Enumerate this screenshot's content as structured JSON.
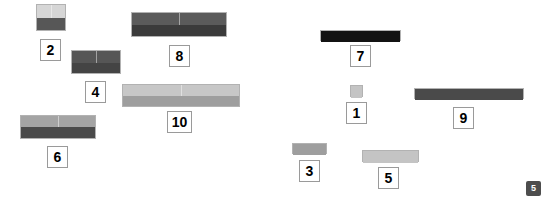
{
  "canvas": {
    "width": 549,
    "height": 205,
    "background": "#ffffff"
  },
  "palette": {
    "very_light_gray": "#e3e3e3",
    "light_gray": "#c9c9c9",
    "medium_light_gray": "#b5b5b5",
    "medium_gray": "#9e9e9e",
    "dark_gray": "#575757",
    "darker_gray": "#3f3f3f",
    "near_black": "#2b2b2b",
    "black": "#111111",
    "label_border": "#9a9a9a",
    "label_text": "#000000",
    "badge_bg": "#4d4d4d",
    "badge_text": "#ffffff"
  },
  "corner_badge": {
    "label": "5",
    "x": 526,
    "y": 181,
    "width": 15,
    "height": 15,
    "font_size": 9
  },
  "chart_data": {
    "type": "bar",
    "title": "",
    "xlabel": "",
    "ylabel": "",
    "categories": [
      "2",
      "8",
      "4",
      "10",
      "6",
      "7",
      "1",
      "9",
      "3",
      "5"
    ],
    "values": [
      2,
      8,
      4,
      10,
      6,
      7,
      1,
      9,
      3,
      5
    ],
    "legend": []
  },
  "rods": [
    {
      "id": "rod-2",
      "label": "2",
      "value": 2,
      "x": 36,
      "y": 4,
      "width": 30,
      "height": 27,
      "cells": 2,
      "top_color": "#d6d6d6",
      "bottom_color": "#575757",
      "top_height": 13,
      "label_x": 40,
      "label_y": 39,
      "label_w": 21,
      "label_h": 22,
      "label_font_size": 14
    },
    {
      "id": "rod-8",
      "label": "8",
      "value": 8,
      "x": 131,
      "y": 12,
      "width": 96,
      "height": 25,
      "cells": 2,
      "top_color": "#5b5b5b",
      "bottom_color": "#3b3b3b",
      "top_height": 12,
      "label_x": 169,
      "label_y": 45,
      "label_w": 21,
      "label_h": 22,
      "label_font_size": 14
    },
    {
      "id": "rod-4",
      "label": "4",
      "value": 4,
      "x": 71,
      "y": 50,
      "width": 50,
      "height": 24,
      "cells": 2,
      "top_color": "#565656",
      "bottom_color": "#444444",
      "top_height": 12,
      "label_x": 85,
      "label_y": 81,
      "label_w": 21,
      "label_h": 22,
      "label_font_size": 14
    },
    {
      "id": "rod-10",
      "label": "10",
      "value": 10,
      "x": 122,
      "y": 84,
      "width": 118,
      "height": 23,
      "cells": 2,
      "top_color": "#c7c7c7",
      "bottom_color": "#9e9e9e",
      "top_height": 11,
      "label_x": 167,
      "label_y": 111,
      "label_w": 25,
      "label_h": 22,
      "label_font_size": 14
    },
    {
      "id": "rod-6",
      "label": "6",
      "value": 6,
      "x": 20,
      "y": 115,
      "width": 76,
      "height": 24,
      "cells": 2,
      "top_color": "#a4a4a4",
      "bottom_color": "#4a4a4a",
      "top_height": 11,
      "label_x": 47,
      "label_y": 146,
      "label_w": 21,
      "label_h": 22,
      "label_font_size": 14
    },
    {
      "id": "rod-7",
      "label": "7",
      "value": 7,
      "x": 320,
      "y": 30,
      "width": 81,
      "height": 11,
      "cells": 1,
      "top_color": "#131313",
      "bottom_color": "#131313",
      "top_height": 11,
      "label_x": 350,
      "label_y": 45,
      "label_w": 21,
      "label_h": 22,
      "label_font_size": 14
    },
    {
      "id": "rod-1",
      "label": "1",
      "value": 1,
      "x": 350,
      "y": 85,
      "width": 13,
      "height": 12,
      "cells": 1,
      "top_color": "#c4c4c4",
      "bottom_color": "#c4c4c4",
      "top_height": 12,
      "label_x": 346,
      "label_y": 102,
      "label_w": 21,
      "label_h": 22,
      "label_font_size": 14
    },
    {
      "id": "rod-9",
      "label": "9",
      "value": 9,
      "x": 414,
      "y": 88,
      "width": 110,
      "height": 11,
      "cells": 1,
      "top_color": "#4a4a4a",
      "bottom_color": "#4a4a4a",
      "top_height": 11,
      "label_x": 453,
      "label_y": 107,
      "label_w": 21,
      "label_h": 22,
      "label_font_size": 14
    },
    {
      "id": "rod-3",
      "label": "3",
      "value": 3,
      "x": 292,
      "y": 143,
      "width": 35,
      "height": 11,
      "cells": 1,
      "top_color": "#9e9e9e",
      "bottom_color": "#9e9e9e",
      "top_height": 11,
      "label_x": 299,
      "label_y": 160,
      "label_w": 21,
      "label_h": 22,
      "label_font_size": 14
    },
    {
      "id": "rod-5",
      "label": "5",
      "value": 5,
      "x": 362,
      "y": 150,
      "width": 57,
      "height": 12,
      "cells": 1,
      "top_color": "#c4c4c4",
      "bottom_color": "#c4c4c4",
      "top_height": 12,
      "label_x": 378,
      "label_y": 167,
      "label_w": 21,
      "label_h": 22,
      "label_font_size": 14
    }
  ]
}
